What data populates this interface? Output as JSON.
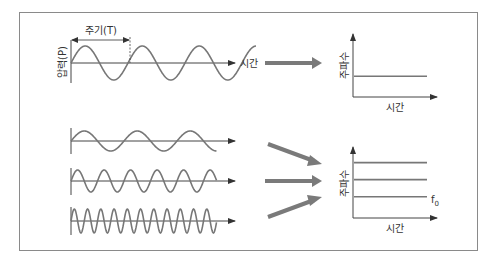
{
  "diagram": {
    "colors": {
      "frame": "#8a8a8a",
      "axis": "#444444",
      "wave": "#777777",
      "block_arrow": "#7a7a7a",
      "text": "#333333"
    },
    "top_panel": {
      "y_axis_label": "압력(P)",
      "x_axis_label": "시간",
      "period_label": "주기(T)",
      "wave": {
        "cycles_shown": 3.25,
        "description": "single sine wave of pressure over time"
      }
    },
    "top_result_graph": {
      "y_axis_label": "주파수",
      "x_axis_label": "시간",
      "lines": [
        {
          "name": "constant-frequency",
          "relative_level": 0.33
        }
      ]
    },
    "bottom_panel": {
      "waves": [
        {
          "name": "low-frequency-wave",
          "relative_frequency": 1,
          "cycles_shown": 2.75
        },
        {
          "name": "mid-frequency-wave",
          "relative_frequency": 2,
          "cycles_shown": 5.5
        },
        {
          "name": "high-frequency-wave",
          "relative_frequency": 4,
          "cycles_shown": 11
        }
      ]
    },
    "bottom_result_graph": {
      "y_axis_label": "주파수",
      "x_axis_label": "시간",
      "f0_label": "f",
      "f0_subscript": "0",
      "lines": [
        {
          "name": "frequency-line-high",
          "relative_level": 0.78
        },
        {
          "name": "frequency-line-mid",
          "relative_level": 0.54
        },
        {
          "name": "frequency-line-f0",
          "relative_level": 0.3
        }
      ]
    }
  }
}
